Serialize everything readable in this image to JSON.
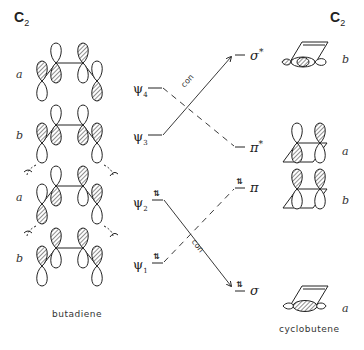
{
  "header": {
    "left_group": {
      "base": "C",
      "sub": "2"
    },
    "right_group": {
      "base": "C",
      "sub": "2"
    }
  },
  "butadiene": {
    "caption": "butadiene",
    "rows": [
      {
        "symmetry": "a"
      },
      {
        "symmetry": "b"
      },
      {
        "symmetry": "a"
      },
      {
        "symmetry": "b"
      }
    ]
  },
  "cyclobutene": {
    "caption": "cyclobutene",
    "rows": [
      {
        "symmetry": "b"
      },
      {
        "symmetry": "a"
      },
      {
        "symmetry": "b"
      },
      {
        "symmetry": "a"
      }
    ]
  },
  "levels_left": [
    {
      "psi": "ψ",
      "index": "4",
      "electrons": ""
    },
    {
      "psi": "ψ",
      "index": "3",
      "electrons": ""
    },
    {
      "psi": "ψ",
      "index": "2",
      "electrons": "⇅"
    },
    {
      "psi": "ψ",
      "index": "1",
      "electrons": "⇅"
    }
  ],
  "levels_right": [
    {
      "symbol": "σ",
      "star": "*",
      "electrons": ""
    },
    {
      "symbol": "π",
      "star": "*",
      "electrons": ""
    },
    {
      "symbol": "π",
      "star": "",
      "electrons": "⇅"
    },
    {
      "symbol": "σ",
      "star": "",
      "electrons": "⇅"
    }
  ],
  "correlations": {
    "con_label_upper": "con",
    "con_label_lower": "con"
  },
  "colors": {
    "ink": "#222222",
    "hatch": "#555555"
  }
}
